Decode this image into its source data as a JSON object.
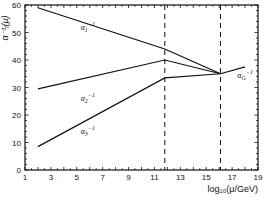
{
  "chart_data": {
    "type": "line",
    "title": "",
    "xlabel": "log10(μ/GeV)",
    "ylabel": "α_i^-1(μ)",
    "xlim": [
      1,
      19
    ],
    "ylim": [
      0,
      60
    ],
    "grid": false,
    "x_ticks": [
      1,
      3,
      5,
      7,
      9,
      11,
      13,
      15,
      17,
      19
    ],
    "y_ticks": [
      0,
      10,
      20,
      30,
      40,
      50,
      60
    ],
    "vertical_dashed_lines": [
      11.8,
      16.1
    ],
    "series": [
      {
        "name": "α1^-1",
        "x": [
          2,
          11.8,
          16.1
        ],
        "values": [
          59,
          44,
          35
        ]
      },
      {
        "name": "α2^-1",
        "x": [
          2,
          11.8,
          16.1
        ],
        "values": [
          29.5,
          40,
          35
        ]
      },
      {
        "name": "α3^-1",
        "x": [
          2,
          11.8,
          16.1
        ],
        "values": [
          8.5,
          33.5,
          35
        ]
      },
      {
        "name": "αG^-1",
        "x": [
          16.1,
          18
        ],
        "values": [
          35,
          37.5
        ]
      }
    ],
    "annotations": [
      {
        "text": "α1^-1",
        "x": 5.3,
        "y": 51
      },
      {
        "text": "α2^-1",
        "x": 5.3,
        "y": 25
      },
      {
        "text": "α3^-1",
        "x": 5.3,
        "y": 13
      },
      {
        "text": "αG^-1",
        "x": 17.4,
        "y": 33.5
      }
    ]
  },
  "labels": {
    "xlabel": "log₁₀(μ/GeV)",
    "ylabel": "α⁻¹ᵢ(μ)",
    "a1": "α",
    "a1sub": "1",
    "a2": "α",
    "a2sub": "2",
    "a3": "α",
    "a3sub": "3",
    "aG": "α",
    "aGsub": "G",
    "sup": "−1"
  }
}
